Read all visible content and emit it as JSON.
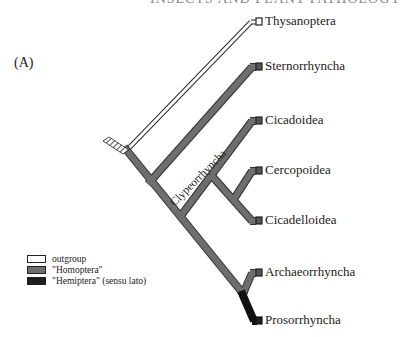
{
  "header": {
    "text": "Insects and Plant Pathology"
  },
  "panel_label": "(A)",
  "colors": {
    "outgroup": "#ffffff",
    "homoptera": "#6e6e6e",
    "hemiptera": "#1e1e1e",
    "outline": "#2a2a2a"
  },
  "taxa": [
    {
      "name": "Thysanoptera",
      "group": "outgroup"
    },
    {
      "name": "Sternorrhyncha",
      "group": "homoptera"
    },
    {
      "name": "Cicadoidea",
      "group": "homoptera"
    },
    {
      "name": "Cercopoidea",
      "group": "homoptera"
    },
    {
      "name": "Cicadelloidea",
      "group": "homoptera"
    },
    {
      "name": "Archaeorrhyncha",
      "group": "homoptera"
    },
    {
      "name": "Prosorrhyncha",
      "group": "hemiptera"
    }
  ],
  "clade_labels": [
    {
      "name": "Clypeorrhyncha"
    }
  ],
  "legend": {
    "items": [
      {
        "label": "outgroup",
        "swatch": "outgroup"
      },
      {
        "label": "\"Homoptera\"",
        "swatch": "homoptera"
      },
      {
        "label": "\"Hemiptera\" (sensu lato)",
        "swatch": "hemiptera"
      }
    ]
  }
}
